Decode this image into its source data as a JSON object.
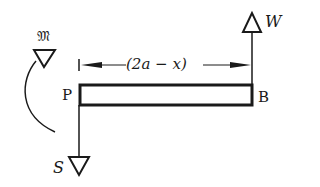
{
  "diagram": {
    "type": "free-body diagram of beam",
    "beam": {
      "left_end_label": "P",
      "right_end_label": "B"
    },
    "dimension": {
      "label": "(2a − x)"
    },
    "forces": [
      {
        "label": "W",
        "location": "B",
        "direction": "up"
      },
      {
        "label": "S",
        "location": "P",
        "direction": "down"
      }
    ],
    "moment": {
      "label": "𝔐",
      "location": "P",
      "sense": "counterclockwise arc"
    },
    "colors": {
      "ink": "#1a1a1a",
      "background": "#ffffff"
    }
  }
}
